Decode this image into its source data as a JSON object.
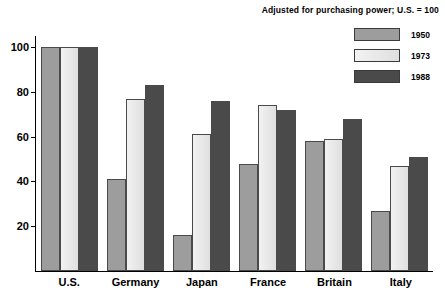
{
  "chart_data": {
    "type": "bar",
    "title": "Adjusted for purchasing power; U.S. = 100",
    "xlabel": "",
    "ylabel": "",
    "ylim": [
      0,
      105
    ],
    "grid": false,
    "legend_position": "top-right",
    "yticks": [
      20,
      40,
      60,
      80,
      100
    ],
    "categories": [
      "U.S.",
      "Germany",
      "Japan",
      "France",
      "Britain",
      "Italy"
    ],
    "series": [
      {
        "name": "1950",
        "values": [
          100,
          41,
          16,
          48,
          58,
          27
        ]
      },
      {
        "name": "1973",
        "values": [
          100,
          77,
          61,
          74,
          59,
          47
        ]
      },
      {
        "name": "1988",
        "values": [
          100,
          83,
          76,
          72,
          68,
          51
        ]
      }
    ]
  },
  "legend": {
    "items": [
      {
        "label": "1950",
        "swatch": "diagonal-hatch-light"
      },
      {
        "label": "1973",
        "swatch": "plain-light"
      },
      {
        "label": "1988",
        "swatch": "dense-hatch-dark"
      }
    ]
  },
  "colors": {
    "fill_1950": "#b9b9b9",
    "fill_1973": "#e8e8e8",
    "fill_1988": "#6e6e6e",
    "axis": "#000000",
    "bar_border": "#4a4a4a",
    "background": "#ffffff"
  }
}
